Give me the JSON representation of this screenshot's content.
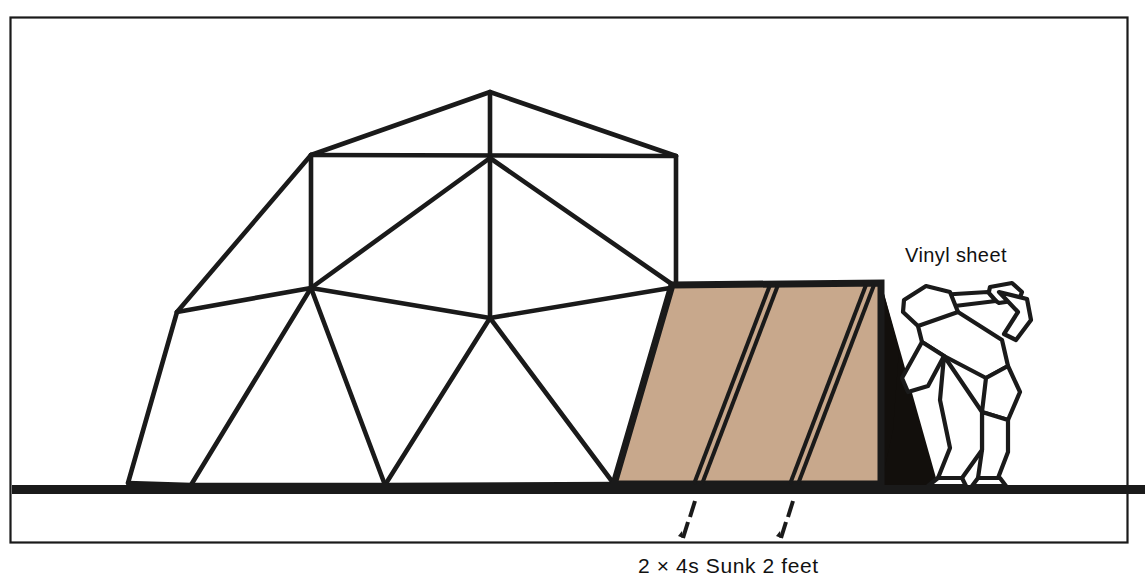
{
  "figure": {
    "background_color": "#ffffff",
    "frame": {
      "name": "illustration-border",
      "stroke_color": "#1a1a1a",
      "x": 10,
      "y": 17,
      "width": 1118,
      "height": 526
    },
    "ground": {
      "name": "ground-line",
      "color": "#1a1a1a",
      "y": 486,
      "x_start": 12,
      "x_end": 1145,
      "thickness": 9
    },
    "labels": {
      "vinyl_sheet": "Vinyl sheet",
      "studs_caption": "2 × 4s Sunk 2 feet"
    },
    "colors": {
      "line": "#1a1a1a",
      "vinyl_fill": "#c8a88c",
      "shadow_fill": "#120f0c",
      "paper": "#ffffff"
    },
    "dome": {
      "name": "geodesic-dome-frame",
      "stroke_width": 4,
      "vertices": {
        "apex": [
          490,
          92
        ],
        "ridge_left": [
          311,
          155
        ],
        "ridge_right": [
          676,
          156
        ],
        "hub_center": [
          490,
          158
        ],
        "mid_left": [
          311,
          288
        ],
        "mid_center": [
          490,
          318
        ],
        "mid_right": [
          676,
          287
        ],
        "shoulder_left": [
          177,
          312
        ],
        "base_far_left": [
          128,
          483
        ],
        "base_left": [
          191,
          485
        ],
        "base_center": [
          385,
          485
        ],
        "base_right": [
          614,
          484
        ],
        "eave_right": [
          672,
          285
        ]
      },
      "struts": [
        [
          "apex",
          "ridge_left"
        ],
        [
          "apex",
          "ridge_right"
        ],
        [
          "apex",
          "hub_center"
        ],
        [
          "ridge_left",
          "ridge_right"
        ],
        [
          "ridge_left",
          "mid_left"
        ],
        [
          "ridge_right",
          "mid_right"
        ],
        [
          "hub_center",
          "mid_left"
        ],
        [
          "hub_center",
          "mid_center"
        ],
        [
          "hub_center",
          "mid_right"
        ],
        [
          "mid_left",
          "mid_center"
        ],
        [
          "mid_center",
          "mid_right"
        ],
        [
          "shoulder_left",
          "ridge_left"
        ],
        [
          "shoulder_left",
          "mid_left"
        ],
        [
          "shoulder_left",
          "base_far_left"
        ],
        [
          "mid_left",
          "base_left"
        ],
        [
          "mid_left",
          "base_center"
        ],
        [
          "mid_center",
          "base_center"
        ],
        [
          "mid_center",
          "base_right"
        ],
        [
          "mid_right",
          "base_right"
        ],
        [
          "base_far_left",
          "base_left"
        ],
        [
          "base_left",
          "base_center"
        ],
        [
          "base_center",
          "base_right"
        ]
      ]
    },
    "vinyl_sheet": {
      "name": "vinyl-sheet-awning",
      "outline": [
        [
          672,
          285
        ],
        [
          881,
          283
        ],
        [
          881,
          484
        ],
        [
          614,
          484
        ]
      ],
      "fill": "#c8a88c",
      "seams": [
        {
          "name": "stud-seam-left",
          "top": [
            768,
            284
          ],
          "bottom": [
            692,
            484
          ]
        },
        {
          "name": "stud-seam-right",
          "top": [
            866,
            284
          ],
          "bottom": [
            790,
            484
          ]
        }
      ]
    },
    "shadow": {
      "name": "entry-shadow",
      "points": [
        [
          881,
          283
        ],
        [
          936,
          484
        ],
        [
          881,
          484
        ]
      ],
      "fill": "#120f0c"
    },
    "leaders": [
      {
        "name": "leader-left",
        "x_top": 692,
        "y_top": 500,
        "x_bottom": 680,
        "y_bottom": 538
      },
      {
        "name": "leader-right",
        "x_top": 790,
        "y_top": 500,
        "x_bottom": 778,
        "y_bottom": 538
      }
    ],
    "vinyl_label_position": [
      905,
      262
    ],
    "caption_position": [
      638,
      573
    ],
    "person": {
      "name": "person-figure",
      "description": "stylized line-art worker bending forward, pushing the vinyl sheet into place",
      "stroke_color": "#1a1a1a"
    }
  }
}
